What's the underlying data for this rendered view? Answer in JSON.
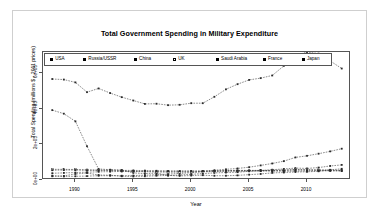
{
  "chart_data": {
    "type": "line",
    "title": "Total Government Spending in Military Expenditure",
    "xlabel": "Year",
    "ylabel": "Total Spending (millions $ - 2011 prices)",
    "xlim": [
      1987.2,
      2013.8
    ],
    "ylim": [
      0,
      720000
    ],
    "xticks": [
      "1990",
      "1995",
      "2000",
      "2005",
      "2010"
    ],
    "xtick_values": [
      1990,
      1995,
      2000,
      2005,
      2010
    ],
    "yticks": [
      "0e+00",
      "2e+05",
      "4e+05",
      "6e+05"
    ],
    "ytick_values": [
      0,
      200000,
      400000,
      600000
    ],
    "grid": false,
    "legend_position": "top-inside",
    "x": [
      1988,
      1989,
      1990,
      1991,
      1992,
      1993,
      1994,
      1995,
      1996,
      1997,
      1998,
      1999,
      2000,
      2001,
      2002,
      2003,
      2004,
      2005,
      2006,
      2007,
      2008,
      2009,
      2010,
      2011,
      2012,
      2013
    ],
    "series": [
      {
        "name": "USA",
        "marker": "filled-square",
        "values": [
          568000,
          565000,
          549000,
          494000,
          515000,
          489000,
          466000,
          447000,
          428000,
          429000,
          421000,
          423000,
          432000,
          432000,
          468000,
          510000,
          539000,
          563000,
          573000,
          588000,
          642000,
          699000,
          720000,
          711000,
          670000,
          627000
        ]
      },
      {
        "name": "Russia/USSR",
        "marker": "filled-square",
        "values": [
          393000,
          373000,
          330000,
          190000,
          62000,
          58000,
          56000,
          40000,
          36000,
          39000,
          25000,
          28000,
          32000,
          36000,
          40000,
          42000,
          44000,
          49000,
          53000,
          58000,
          62000,
          67000,
          65000,
          70000,
          79000,
          85000
        ]
      },
      {
        "name": "China",
        "marker": "filled-square",
        "values": [
          21000,
          20000,
          21000,
          22000,
          24000,
          24000,
          24000,
          25000,
          27000,
          30000,
          33000,
          37000,
          41000,
          48000,
          55000,
          60000,
          65000,
          72000,
          82000,
          93000,
          106000,
          127000,
          136000,
          148000,
          161000,
          176000
        ]
      },
      {
        "name": "UK",
        "marker": "hollow-square",
        "values": [
          60000,
          60000,
          59000,
          57000,
          55000,
          53000,
          51000,
          48000,
          47000,
          45000,
          44000,
          44000,
          45000,
          46000,
          48000,
          50000,
          51000,
          52000,
          53000,
          54000,
          56000,
          59000,
          58000,
          57000,
          56000,
          54000
        ]
      },
      {
        "name": "Saudi Arabia",
        "marker": "filled-square",
        "values": [
          24000,
          23000,
          34000,
          39000,
          28000,
          27000,
          21000,
          20000,
          21000,
          24000,
          26000,
          23000,
          25000,
          27000,
          24000,
          24000,
          26000,
          30000,
          34000,
          40000,
          42000,
          45000,
          46000,
          49000,
          57000,
          63000
        ]
      },
      {
        "name": "France",
        "marker": "filled-square",
        "values": [
          55000,
          56000,
          56000,
          55000,
          55000,
          56000,
          54000,
          54000,
          53000,
          52000,
          50000,
          50000,
          50000,
          50000,
          51000,
          53000,
          54000,
          54000,
          54000,
          54000,
          54000,
          57000,
          56000,
          55000,
          54000,
          53000
        ]
      },
      {
        "name": "Japan",
        "marker": "filled-square",
        "values": [
          38000,
          40000,
          42000,
          44000,
          46000,
          47000,
          48000,
          49000,
          49000,
          49000,
          50000,
          50000,
          50000,
          50000,
          51000,
          51000,
          51000,
          51000,
          50000,
          50000,
          49000,
          50000,
          51000,
          52000,
          51000,
          50000
        ]
      }
    ]
  },
  "legend": {
    "items": [
      {
        "label": "USA",
        "marker": "filled-square"
      },
      {
        "label": "Russia/USSR",
        "marker": "filled-square"
      },
      {
        "label": "China",
        "marker": "filled-square"
      },
      {
        "label": "UK",
        "marker": "hollow-square"
      },
      {
        "label": "Saudi Arabia",
        "marker": "filled-square"
      },
      {
        "label": "France",
        "marker": "filled-square"
      },
      {
        "label": "Japan",
        "marker": "filled-square"
      }
    ]
  },
  "colors": {
    "line": "#2b2b2b",
    "axis": "#555555",
    "frame": "#cfcfcf",
    "background": "#ffffff"
  }
}
